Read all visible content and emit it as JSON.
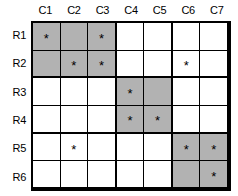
{
  "figure": {
    "type": "block-incidence-matrix",
    "mark_glyph": "*",
    "shade_color": "#b2b2b2",
    "background_color": "#ffffff",
    "line_color": "#000000"
  },
  "columns": [
    {
      "label": "C1"
    },
    {
      "label": "C2"
    },
    {
      "label": "C3"
    },
    {
      "label": "C4"
    },
    {
      "label": "C5"
    },
    {
      "label": "C6"
    },
    {
      "label": "C7"
    }
  ],
  "rows": [
    {
      "label": "R1"
    },
    {
      "label": "R2"
    },
    {
      "label": "R3"
    },
    {
      "label": "R4"
    },
    {
      "label": "R5"
    },
    {
      "label": "R6"
    }
  ],
  "blocks": [
    {
      "rows": [
        "R1",
        "R2"
      ],
      "columns": [
        "C1",
        "C2",
        "C3"
      ]
    },
    {
      "rows": [
        "R3",
        "R4"
      ],
      "columns": [
        "C4",
        "C5"
      ]
    },
    {
      "rows": [
        "R5",
        "R6"
      ],
      "columns": [
        "C6",
        "C7"
      ]
    }
  ],
  "cells": [
    [
      {
        "mark": "*",
        "shaded": true
      },
      {
        "mark": "",
        "shaded": true
      },
      {
        "mark": "*",
        "shaded": true
      },
      {
        "mark": "",
        "shaded": false
      },
      {
        "mark": "",
        "shaded": false
      },
      {
        "mark": "",
        "shaded": false
      },
      {
        "mark": "",
        "shaded": false
      }
    ],
    [
      {
        "mark": "",
        "shaded": true
      },
      {
        "mark": "*",
        "shaded": true
      },
      {
        "mark": "*",
        "shaded": true
      },
      {
        "mark": "",
        "shaded": false
      },
      {
        "mark": "",
        "shaded": false
      },
      {
        "mark": "*",
        "shaded": false
      },
      {
        "mark": "",
        "shaded": false
      }
    ],
    [
      {
        "mark": "",
        "shaded": false
      },
      {
        "mark": "",
        "shaded": false
      },
      {
        "mark": "",
        "shaded": false
      },
      {
        "mark": "*",
        "shaded": true
      },
      {
        "mark": "",
        "shaded": true
      },
      {
        "mark": "",
        "shaded": false
      },
      {
        "mark": "",
        "shaded": false
      }
    ],
    [
      {
        "mark": "",
        "shaded": false
      },
      {
        "mark": "",
        "shaded": false
      },
      {
        "mark": "",
        "shaded": false
      },
      {
        "mark": "*",
        "shaded": true
      },
      {
        "mark": "*",
        "shaded": true
      },
      {
        "mark": "",
        "shaded": false
      },
      {
        "mark": "",
        "shaded": false
      }
    ],
    [
      {
        "mark": "",
        "shaded": false
      },
      {
        "mark": "*",
        "shaded": false
      },
      {
        "mark": "",
        "shaded": false
      },
      {
        "mark": "",
        "shaded": false
      },
      {
        "mark": "",
        "shaded": false
      },
      {
        "mark": "*",
        "shaded": true
      },
      {
        "mark": "*",
        "shaded": true
      }
    ],
    [
      {
        "mark": "",
        "shaded": false
      },
      {
        "mark": "",
        "shaded": false
      },
      {
        "mark": "",
        "shaded": false
      },
      {
        "mark": "",
        "shaded": false
      },
      {
        "mark": "",
        "shaded": false
      },
      {
        "mark": "",
        "shaded": true
      },
      {
        "mark": "*",
        "shaded": true
      }
    ]
  ]
}
